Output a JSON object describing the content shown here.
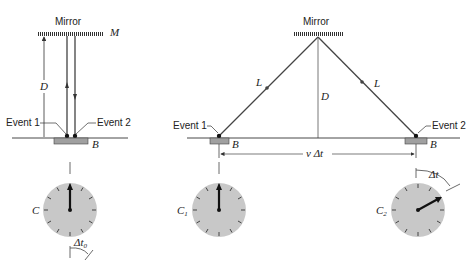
{
  "left_panel": {
    "mirror_label": "Mirror",
    "mirror_symbol": "M",
    "distance_label": "D",
    "event1_label": "Event 1",
    "event2_label": "Event 2",
    "base_label": "B",
    "clock_label": "C",
    "interval_label": "Δt",
    "interval_subscript": "0"
  },
  "right_panel": {
    "mirror_label": "Mirror",
    "path_label_left": "L",
    "path_label_right": "L",
    "distance_label": "D",
    "event1_label": "Event 1",
    "event2_label": "Event 2",
    "base_label_left": "B",
    "base_label_right": "B",
    "displacement_label": "v Δt",
    "clock1_label": "C",
    "clock1_subscript": "1",
    "clock2_label": "C",
    "clock2_subscript": "2",
    "interval_label": "Δt"
  },
  "colors": {
    "line": "#333333",
    "clock_face": "#c8c8c8",
    "block": "#a0a0a0"
  }
}
